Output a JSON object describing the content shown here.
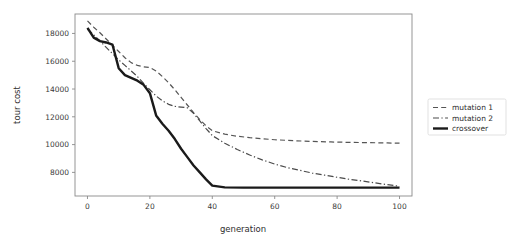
{
  "chart_data": {
    "type": "line",
    "title": "",
    "xlabel": "generation",
    "ylabel": "tour cost",
    "xlim": [
      -4,
      104
    ],
    "ylim": [
      6300,
      19400
    ],
    "xticks": [
      "0",
      "20",
      "40",
      "60",
      "80",
      "100"
    ],
    "xtick_values": [
      0,
      20,
      40,
      60,
      80,
      100
    ],
    "yticks": [
      "8000",
      "10000",
      "12000",
      "14000",
      "16000",
      "18000"
    ],
    "ytick_values": [
      8000,
      10000,
      12000,
      14000,
      16000,
      18000
    ],
    "grid": false,
    "legend_position": "right-outside",
    "series": [
      {
        "name": "mutation 1",
        "style": "dashed",
        "color": "#555555",
        "width": 1.2,
        "x": [
          0,
          2,
          4,
          6,
          8,
          10,
          12,
          14,
          16,
          18,
          20,
          22,
          24,
          26,
          28,
          30,
          32,
          34,
          36,
          38,
          40,
          44,
          48,
          52,
          56,
          60,
          66,
          72,
          78,
          84,
          90,
          96,
          100
        ],
        "y": [
          18900,
          18450,
          18050,
          17600,
          17150,
          16700,
          16250,
          15900,
          15700,
          15600,
          15550,
          15300,
          14900,
          14450,
          13950,
          13400,
          12850,
          12300,
          11800,
          11350,
          11000,
          10750,
          10600,
          10500,
          10420,
          10350,
          10280,
          10230,
          10190,
          10160,
          10140,
          10120,
          10100
        ]
      },
      {
        "name": "mutation 2",
        "style": "dashdot",
        "color": "#4a4a4a",
        "width": 1.2,
        "x": [
          0,
          2,
          4,
          6,
          8,
          10,
          12,
          14,
          16,
          18,
          20,
          22,
          24,
          26,
          28,
          30,
          32,
          34,
          36,
          38,
          40,
          44,
          48,
          52,
          56,
          60,
          64,
          68,
          72,
          76,
          80,
          84,
          88,
          92,
          96,
          100
        ],
        "y": [
          18300,
          17900,
          17450,
          17000,
          16550,
          16100,
          15700,
          15300,
          14900,
          14400,
          13950,
          13500,
          13150,
          12900,
          12750,
          12700,
          12650,
          12250,
          11700,
          11150,
          10650,
          10100,
          9650,
          9250,
          8900,
          8600,
          8350,
          8150,
          7950,
          7800,
          7650,
          7500,
          7380,
          7250,
          7120,
          7000
        ]
      },
      {
        "name": "crossover",
        "style": "solid",
        "color": "#1a1a1a",
        "width": 2.4,
        "x": [
          0,
          2,
          4,
          6,
          8,
          10,
          12,
          14,
          16,
          18,
          20,
          22,
          24,
          26,
          28,
          30,
          32,
          34,
          36,
          38,
          40,
          44,
          50,
          56,
          62,
          68,
          74,
          80,
          86,
          92,
          96,
          100
        ],
        "y": [
          18400,
          17700,
          17450,
          17350,
          17200,
          15500,
          15000,
          14800,
          14600,
          14300,
          13700,
          12100,
          11500,
          11000,
          10400,
          9700,
          9100,
          8500,
          8000,
          7500,
          7050,
          6920,
          6900,
          6900,
          6900,
          6900,
          6900,
          6900,
          6900,
          6900,
          6900,
          6900
        ]
      }
    ]
  },
  "legend": {
    "items": [
      {
        "label": "mutation 1"
      },
      {
        "label": "mutation 2"
      },
      {
        "label": "crossover"
      }
    ]
  }
}
